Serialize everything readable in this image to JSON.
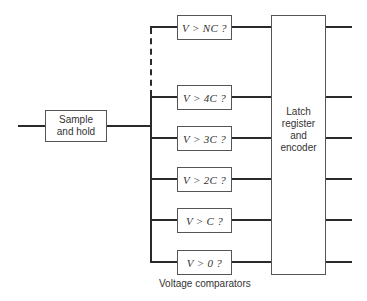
{
  "diagram": {
    "title": "",
    "input_block": {
      "label": "Sample and hold"
    },
    "comparators": [
      {
        "label": "V > NC ?"
      },
      {
        "label": "V > 4C ?"
      },
      {
        "label": "V > 3C ?"
      },
      {
        "label": "V > 2C ?"
      },
      {
        "label": "V > C ?"
      },
      {
        "label": "V > 0 ?"
      }
    ],
    "comparators_caption": "Voltage comparators",
    "output_block": {
      "label": "Latch register and encoder"
    },
    "colors": {
      "line": "#2a2a2a",
      "box_border": "#555555",
      "text": "#333333"
    }
  }
}
